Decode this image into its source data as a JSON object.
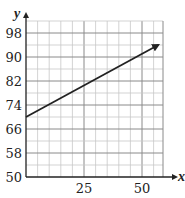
{
  "chart_data": {
    "type": "line",
    "title": "",
    "xlabel": "x",
    "ylabel": "y",
    "xlim": [
      0,
      60
    ],
    "ylim": [
      50,
      102
    ],
    "x_ticks": [
      25,
      50
    ],
    "y_ticks": [
      50,
      58,
      66,
      74,
      82,
      90,
      98
    ],
    "grid": true,
    "series": [
      {
        "name": "line",
        "x": [
          0,
          57
        ],
        "y": [
          70,
          94
        ],
        "arrow_end": true,
        "color": "#222222"
      }
    ]
  },
  "labels": {
    "x_axis": "x",
    "y_axis": "y",
    "x_ticks": [
      "25",
      "50"
    ],
    "y_ticks": [
      "98",
      "90",
      "82",
      "74",
      "66",
      "58",
      "50"
    ]
  }
}
